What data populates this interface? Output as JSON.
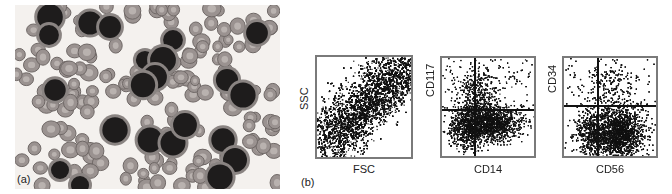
{
  "figure": {
    "panel_a": {
      "label": "(a)",
      "description": "Blood smear micrograph with dark blast cells among red blood cells"
    },
    "panel_b": {
      "label": "(b)",
      "plots": [
        {
          "x_label": "FSC",
          "y_label": "SSC",
          "gates": false
        },
        {
          "x_label": "CD14",
          "y_label": "CD117",
          "gates": true
        },
        {
          "x_label": "CD56",
          "y_label": "CD34",
          "gates": true
        }
      ]
    }
  },
  "colors": {
    "dots": "#111111",
    "frame": "#7a7a7a",
    "background": "#ffffff"
  }
}
